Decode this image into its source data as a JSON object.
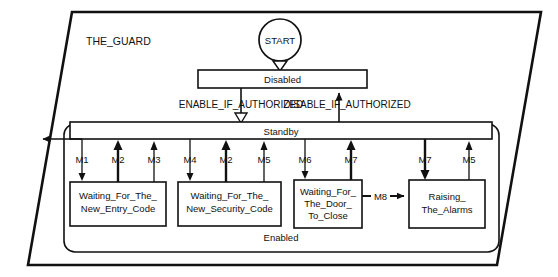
{
  "diagram": {
    "title": "THE_GUARD",
    "outer_shape": "parallelogram",
    "start": {
      "label": "START",
      "shape": "circle"
    },
    "states": {
      "disabled": {
        "label": "Disabled"
      },
      "standby": {
        "label": "Standby"
      },
      "enabled_region": {
        "label": "Enabled"
      },
      "waiting_entry": {
        "line1": "Waiting_For_The_",
        "line2": "New_Entry_Code"
      },
      "waiting_security": {
        "line1": "Waiting_For_The_",
        "line2": "New_Security_Code"
      },
      "waiting_door": {
        "line1": "Waiting_For_",
        "line2": "The_Door_",
        "line3": "To_Close"
      },
      "raising_alarms": {
        "line1": "Raising_",
        "line2": "The_Alarms"
      }
    },
    "transitions": {
      "enable": {
        "label": "ENABLE_IF_AUTHORIZED"
      },
      "disable": {
        "label": "DISABLE_IF_AUTHORIZED"
      },
      "m1": {
        "label": "M1"
      },
      "m2a": {
        "label": "M2"
      },
      "m3": {
        "label": "M3"
      },
      "m4": {
        "label": "M4"
      },
      "m2b": {
        "label": "M2"
      },
      "m5a": {
        "label": "M5"
      },
      "m6": {
        "label": "M6"
      },
      "m7a": {
        "label": "M7"
      },
      "m7b": {
        "label": "M7"
      },
      "m5b": {
        "label": "M5"
      },
      "m8": {
        "label": "M8"
      }
    },
    "colors": {
      "line": "#111111",
      "background": "#ffffff",
      "text": "#111111"
    }
  }
}
